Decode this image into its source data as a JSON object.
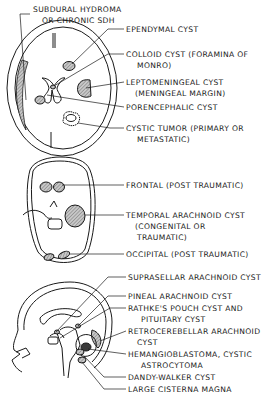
{
  "figure": {
    "panels": [
      {
        "name": "axial-section-upper",
        "labels": [
          {
            "text": "SUBDURAL HYDROMA",
            "x": 33,
            "y": 4
          },
          {
            "text": "OR CHRONIC SDH",
            "x": 42,
            "y": 15
          },
          {
            "text": "EPENDYMAL CYST",
            "x": 126,
            "y": 26
          },
          {
            "text": "COLLOID CYST (FORAMINA OF",
            "x": 126,
            "y": 51
          },
          {
            "text": "MONRO)",
            "x": 137,
            "y": 62
          },
          {
            "text": "LEPTOMENINGEAL CYST",
            "x": 126,
            "y": 78
          },
          {
            "text": "(MENINGEAL MARGIN)",
            "x": 135,
            "y": 89
          },
          {
            "text": "PORENCEPHALIC CYST",
            "x": 126,
            "y": 103
          },
          {
            "text": "CYSTIC TUMOR (PRIMARY OR",
            "x": 126,
            "y": 124
          },
          {
            "text": "METASTATIC)",
            "x": 137,
            "y": 135
          }
        ]
      },
      {
        "name": "axial-section-skull-base",
        "labels": [
          {
            "text": "FRONTAL (POST TRAUMATIC)",
            "x": 126,
            "y": 179
          },
          {
            "text": "TEMPORAL ARACHNOID CYST",
            "x": 126,
            "y": 209
          },
          {
            "text": "(CONGENITAL OR",
            "x": 135,
            "y": 220
          },
          {
            "text": "TRAUMATIC)",
            "x": 137,
            "y": 232
          },
          {
            "text": "OCCIPITAL (POST TRAUMATIC)",
            "x": 126,
            "y": 248
          }
        ]
      },
      {
        "name": "sagittal-section",
        "labels": [
          {
            "text": "SUPRASELLAR ARACHNOID CYST",
            "x": 128,
            "y": 273
          },
          {
            "text": "PINEAL ARACHNOID CYST",
            "x": 128,
            "y": 292
          },
          {
            "text": "RATHKE'S POUCH CYST AND",
            "x": 128,
            "y": 304
          },
          {
            "text": "PITUITARY CYST",
            "x": 141,
            "y": 315
          },
          {
            "text": "RETROCEREBELLAR ARACHNOID",
            "x": 128,
            "y": 327
          },
          {
            "text": "CYST",
            "x": 137,
            "y": 338
          },
          {
            "text": "HEMANGIOBLASTOMA, CYSTIC",
            "x": 128,
            "y": 350
          },
          {
            "text": "ASTROCYTOMA",
            "x": 141,
            "y": 361
          },
          {
            "text": "DANDY-WALKER CYST",
            "x": 128,
            "y": 373
          },
          {
            "text": "LARGE CISTERNA MAGNA",
            "x": 128,
            "y": 385
          }
        ]
      }
    ]
  },
  "colors": {
    "ink": "#1a1a1a",
    "hatch": "#9a9a9a",
    "background": "#ffffff"
  }
}
